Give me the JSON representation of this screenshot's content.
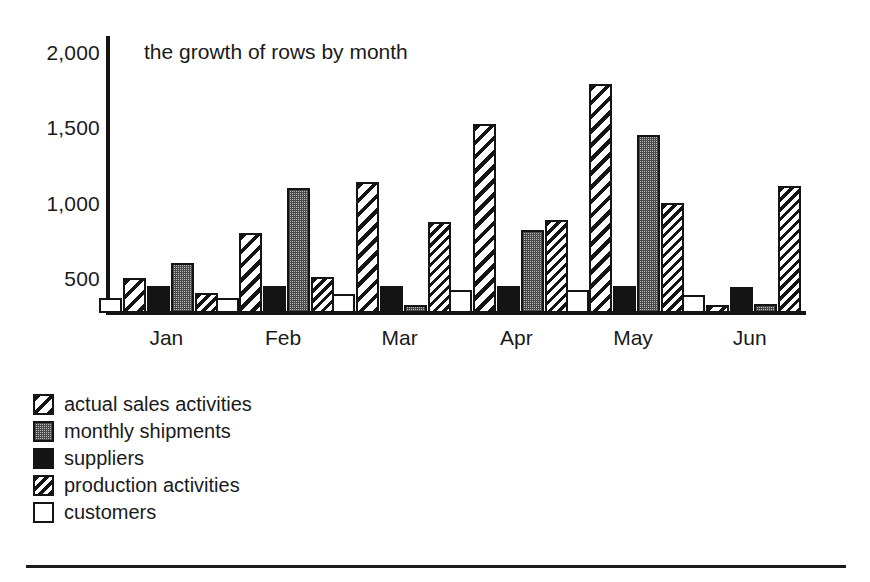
{
  "chart_data": {
    "type": "bar",
    "title": "the growth of rows by month",
    "xlabel": "",
    "ylabel": "",
    "ylim": [
      0,
      2000
    ],
    "yticks": [
      500,
      1000,
      1500,
      2000
    ],
    "ytick_labels": [
      "500",
      "1,000",
      "1,500",
      "2,000"
    ],
    "grid": false,
    "legend_position": "below-left",
    "categories": [
      "Jan",
      "Feb",
      "Mar",
      "Apr",
      "May",
      "Jun"
    ],
    "series": [
      {
        "name": "customers",
        "pattern": "empty-white",
        "color": "#ffffff",
        "values": [
          370,
          370,
          395,
          420,
          420,
          390
        ]
      },
      {
        "name": "actual sales activities",
        "pattern": "wide-backslash-hatch",
        "color": "#141414",
        "values": [
          500,
          800,
          1140,
          1525,
          1790,
          320
        ]
      },
      {
        "name": "suppliers",
        "pattern": "solid-black",
        "color": "#141414",
        "values": [
          450,
          450,
          450,
          450,
          450,
          440
        ]
      },
      {
        "name": "monthly shipments",
        "pattern": "gray-stipple",
        "color": "#b9b9b9",
        "values": [
          600,
          1100,
          320,
          820,
          1450,
          330
        ]
      },
      {
        "name": "production activities",
        "pattern": "narrow-backslash-hatch",
        "color": "#141414",
        "values": [
          400,
          510,
          875,
          885,
          1000,
          1110
        ]
      }
    ]
  },
  "legend": {
    "items": [
      {
        "label": "actual sales activities",
        "pattern": "wide-backslash-hatch"
      },
      {
        "label": "monthly shipments",
        "pattern": "gray-stipple"
      },
      {
        "label": "suppliers",
        "pattern": "solid-black"
      },
      {
        "label": "production activities",
        "pattern": "narrow-backslash-hatch"
      },
      {
        "label": "customers",
        "pattern": "empty-white"
      }
    ]
  },
  "axis": {
    "y_tick_labels": [
      "2,000",
      "1,500",
      "1,000",
      "500"
    ],
    "x_tick_labels": [
      "Jan",
      "Feb",
      "Mar",
      "Apr",
      "May",
      "Jun"
    ]
  },
  "colors": {
    "ink": "#141414",
    "gray_fill": "#b9b9b9",
    "background": "#ffffff"
  }
}
